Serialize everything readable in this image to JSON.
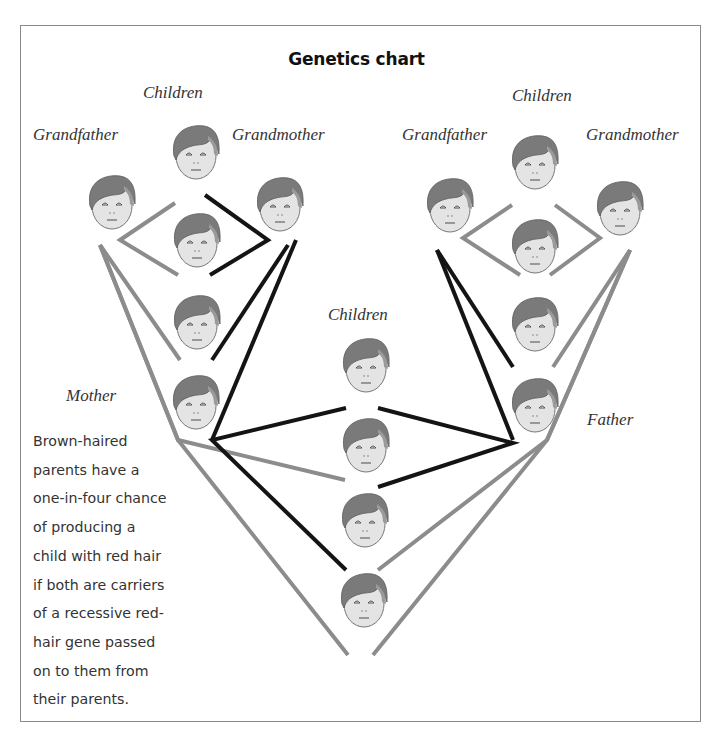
{
  "title": "Genetics chart",
  "colors": {
    "gray_line": "#8c8c8c",
    "black_line": "#141414",
    "hair": "#7a7a7a",
    "skin": "#e4e4e4",
    "frame": "#8a8a8a"
  },
  "labels": {
    "left_children": "Children",
    "left_grandfather": "Grandfather",
    "left_grandmother": "Grandmother",
    "right_children": "Children",
    "right_grandfather": "Grandfather",
    "right_grandmother": "Grandmother",
    "center_children": "Children",
    "mother": "Mother",
    "father": "Father"
  },
  "caption": {
    "lines": [
      "Brown-haired",
      "parents have a",
      "one-in-four chance",
      "of producing a",
      "child with red hair",
      "if both are carriers",
      "of a recessive red-",
      "hair gene passed",
      "on to them from",
      "their parents."
    ]
  },
  "faces": {
    "left_family": [
      "grandfather",
      "child-top",
      "grandmother",
      "child-2",
      "child-3",
      "mother"
    ],
    "right_family": [
      "grandfather",
      "child-top",
      "grandmother",
      "child-2",
      "child-3",
      "father"
    ],
    "center_children": [
      "child-1",
      "child-2",
      "child-3",
      "child-4"
    ]
  }
}
